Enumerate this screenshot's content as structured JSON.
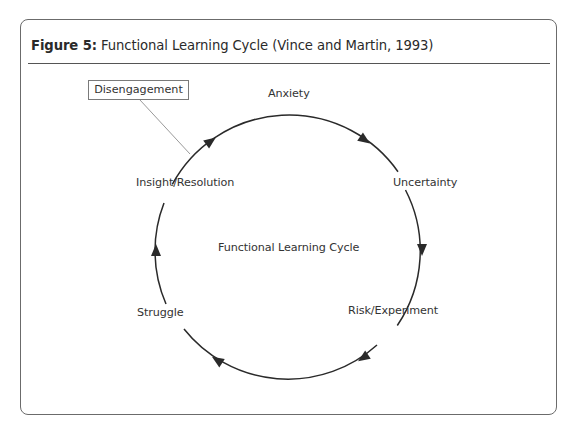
{
  "figure": {
    "number_label": "Figure 5:",
    "caption": " Functional Learning Cycle (Vince and Martin, 1993)"
  },
  "diagram": {
    "type": "cycle",
    "direction": "clockwise",
    "center_label": "Functional Learning Cycle",
    "stages": [
      {
        "label": "Anxiety"
      },
      {
        "label": "Uncertainty"
      },
      {
        "label": "Risk/Experiment"
      },
      {
        "label": "Struggle"
      },
      {
        "label": "Insight/Resolution"
      }
    ],
    "callout": {
      "label": "Disengagement",
      "points_to": "arc between Insight/Resolution and Anxiety"
    },
    "colors": {
      "line": "#2a2a2a",
      "frame": "#6b6b6b",
      "callout_border": "#7a7a7a",
      "leader_line": "#9a9a9a"
    }
  }
}
